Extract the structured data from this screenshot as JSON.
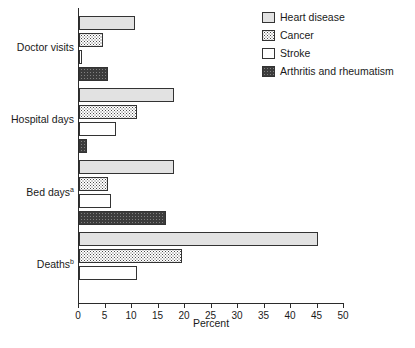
{
  "chart_data": {
    "type": "bar",
    "orientation": "horizontal",
    "title": "",
    "xlabel": "Percent",
    "ylabel": "",
    "xlim": [
      0,
      50
    ],
    "xticks": [
      0,
      5,
      10,
      15,
      20,
      25,
      30,
      35,
      40,
      45,
      50
    ],
    "grid": false,
    "legend_position": "top-right",
    "categories": [
      "Doctor visits",
      "Hospital days",
      "Bed days",
      "Deaths"
    ],
    "category_labels_display": [
      {
        "text": "Doctor visits",
        "superscript": ""
      },
      {
        "text": "Hospital days",
        "superscript": ""
      },
      {
        "text": "Bed days",
        "superscript": "a"
      },
      {
        "text": "Deaths",
        "superscript": "b"
      }
    ],
    "series": [
      {
        "name": "Heart disease",
        "fill": "light-gray",
        "color": "#e2e2e2",
        "values": [
          10.5,
          18.0,
          18.0,
          45.0
        ]
      },
      {
        "name": "Cancer",
        "fill": "dotted",
        "color": "#ffffff",
        "values": [
          4.5,
          11.0,
          5.5,
          19.5
        ]
      },
      {
        "name": "Stroke",
        "fill": "white",
        "color": "#ffffff",
        "values": [
          0.5,
          7.0,
          6.0,
          11.0
        ]
      },
      {
        "name": "Arthritis and rheumatism",
        "fill": "dark-gray",
        "color": "#3c3c3c",
        "values": [
          5.5,
          1.5,
          16.5,
          0.0
        ]
      }
    ]
  },
  "legend": {
    "items": [
      {
        "label": "Heart disease"
      },
      {
        "label": "Cancer"
      },
      {
        "label": "Stroke"
      },
      {
        "label": "Arthritis and rheumatism"
      }
    ]
  },
  "axis": {
    "x_label": "Percent",
    "tick_labels": [
      "0",
      "5",
      "10",
      "15",
      "20",
      "25",
      "30",
      "35",
      "40",
      "45",
      "50"
    ]
  }
}
